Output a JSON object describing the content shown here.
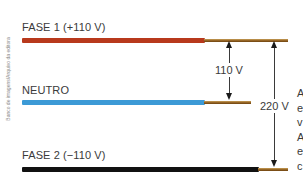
{
  "credit": "Banco de imagens/Arquivo da editora",
  "wires": {
    "fase1": {
      "label": "FASE 1 (+110 V)",
      "color": "#b8391c"
    },
    "neutro": {
      "label": "NEUTRO",
      "color": "#3c9ad6"
    },
    "fase2": {
      "label": "FASE 2 (−110 V)",
      "color": "#111111"
    }
  },
  "core_color": "#8c5a1c",
  "measurements": {
    "phase_to_neutral": "110 V",
    "phase_to_phase": "220 V"
  },
  "edge_text": [
    "A",
    "e",
    "v",
    "A",
    "e",
    "c"
  ]
}
